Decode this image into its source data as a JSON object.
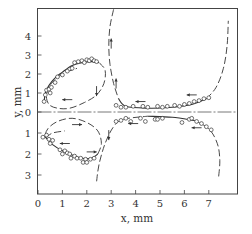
{
  "chart_data": {
    "type": "scatter",
    "title": "",
    "xlabel": "x, mm",
    "ylabel": "y, mm",
    "xlim": [
      0,
      8.2
    ],
    "ylim_upper": [
      0,
      5.4
    ],
    "ylim_lower": [
      0,
      3.9
    ],
    "x_ticks": [
      "0",
      "1",
      "2",
      "3",
      "4",
      "5",
      "6",
      "7"
    ],
    "y_ticks_upper": [
      "4",
      "3",
      "2",
      "1",
      "0"
    ],
    "y_ticks_lower": [
      "1",
      "2",
      "3"
    ],
    "grid": false,
    "legend": null,
    "center_line": "horizontal dash-dot line at y = 0",
    "colors": {
      "ink": "#333333",
      "frame": "#444444",
      "background": "#ffffff"
    },
    "series": [
      {
        "name": "upper-left loop measured points",
        "panel": "upper",
        "marker": "open-circle",
        "points": [
          [
            0.25,
            0.55
          ],
          [
            0.3,
            0.9
          ],
          [
            0.35,
            1.15
          ],
          [
            0.45,
            1.2
          ],
          [
            0.5,
            1.0
          ],
          [
            0.55,
            1.3
          ],
          [
            0.7,
            1.55
          ],
          [
            0.8,
            1.85
          ],
          [
            1.0,
            1.95
          ],
          [
            1.2,
            2.15
          ],
          [
            1.4,
            2.3
          ],
          [
            1.5,
            2.6
          ],
          [
            1.65,
            2.65
          ],
          [
            1.8,
            2.7
          ],
          [
            1.9,
            2.6
          ],
          [
            2.0,
            2.75
          ],
          [
            2.1,
            2.7
          ],
          [
            2.2,
            2.8
          ],
          [
            2.3,
            2.7
          ],
          [
            2.4,
            2.65
          ]
        ]
      },
      {
        "name": "upper-right curve measured points",
        "panel": "upper",
        "marker": "open-circle",
        "points": [
          [
            3.2,
            0.35
          ],
          [
            3.4,
            0.25
          ],
          [
            3.6,
            0.25
          ],
          [
            3.9,
            0.3
          ],
          [
            4.3,
            0.3
          ],
          [
            4.5,
            0.25
          ],
          [
            4.9,
            0.3
          ],
          [
            5.1,
            0.25
          ],
          [
            5.3,
            0.3
          ],
          [
            5.6,
            0.35
          ],
          [
            5.8,
            0.3
          ],
          [
            6.0,
            0.4
          ],
          [
            6.2,
            0.45
          ],
          [
            6.4,
            0.55
          ],
          [
            6.6,
            0.6
          ],
          [
            6.8,
            0.7
          ],
          [
            7.0,
            0.75
          ]
        ]
      },
      {
        "name": "lower-left loop measured points",
        "panel": "lower",
        "marker": "open-circle",
        "points": [
          [
            0.2,
            1.2
          ],
          [
            0.35,
            1.1
          ],
          [
            0.45,
            1.3
          ],
          [
            0.5,
            1.5
          ],
          [
            0.6,
            1.35
          ],
          [
            0.9,
            1.8
          ],
          [
            1.0,
            2.0
          ],
          [
            1.1,
            1.85
          ],
          [
            1.2,
            1.95
          ],
          [
            1.3,
            2.0
          ],
          [
            1.35,
            2.2
          ],
          [
            1.5,
            2.1
          ],
          [
            1.6,
            2.2
          ],
          [
            1.75,
            2.2
          ],
          [
            1.85,
            2.4
          ],
          [
            1.95,
            2.25
          ],
          [
            2.0,
            2.4
          ],
          [
            2.15,
            2.25
          ],
          [
            2.3,
            2.2
          ]
        ]
      },
      {
        "name": "lower-right curve measured points",
        "panel": "lower",
        "marker": "open-circle",
        "points": [
          [
            3.2,
            0.45
          ],
          [
            3.4,
            0.4
          ],
          [
            3.6,
            0.3
          ],
          [
            3.8,
            0.45
          ],
          [
            4.2,
            0.3
          ],
          [
            4.4,
            0.45
          ],
          [
            4.8,
            0.35
          ],
          [
            4.9,
            0.35
          ],
          [
            5.1,
            0.3
          ],
          [
            5.9,
            0.5
          ],
          [
            6.2,
            0.35
          ],
          [
            6.3,
            0.3
          ],
          [
            6.5,
            0.45
          ],
          [
            6.7,
            0.55
          ],
          [
            6.9,
            0.7
          ],
          [
            7.1,
            0.85
          ]
        ]
      },
      {
        "name": "upper-left computed trajectory (solid)",
        "panel": "upper",
        "style": "solid",
        "points": [
          [
            0.25,
            0.5
          ],
          [
            0.3,
            1.0
          ],
          [
            0.45,
            1.4
          ],
          [
            0.7,
            1.8
          ],
          [
            1.0,
            2.1
          ],
          [
            1.4,
            2.45
          ],
          [
            1.8,
            2.6
          ],
          [
            2.2,
            2.65
          ],
          [
            2.5,
            2.6
          ]
        ]
      },
      {
        "name": "upper-left computed trajectory (dashed loop)",
        "panel": "upper",
        "style": "dashed",
        "points": [
          [
            2.5,
            2.6
          ],
          [
            2.75,
            2.2
          ],
          [
            2.7,
            1.5
          ],
          [
            2.4,
            0.9
          ],
          [
            1.9,
            0.5
          ],
          [
            1.3,
            0.2
          ],
          [
            0.8,
            0.2
          ],
          [
            0.45,
            0.4
          ],
          [
            0.35,
            0.9
          ],
          [
            0.55,
            1.5
          ],
          [
            1.0,
            2.0
          ],
          [
            1.6,
            2.3
          ]
        ]
      },
      {
        "name": "upper-right computed trajectory",
        "panel": "upper",
        "style": "dashed-then-solid",
        "points": [
          [
            3.1,
            5.4
          ],
          [
            2.95,
            4.5
          ],
          [
            2.9,
            3.5
          ],
          [
            2.95,
            2.5
          ],
          [
            3.1,
            1.5
          ],
          [
            3.3,
            0.7
          ],
          [
            3.6,
            0.3
          ],
          [
            4.5,
            0.2
          ],
          [
            5.5,
            0.25
          ],
          [
            6.3,
            0.4
          ],
          [
            6.9,
            0.7
          ],
          [
            7.3,
            1.3
          ],
          [
            7.6,
            2.3
          ],
          [
            7.75,
            3.5
          ],
          [
            7.8,
            4.8
          ]
        ]
      },
      {
        "name": "lower-left computed trajectory (solid)",
        "panel": "lower",
        "style": "solid",
        "points": [
          [
            0.3,
            1.2
          ],
          [
            0.6,
            1.55
          ],
          [
            1.0,
            1.85
          ],
          [
            1.4,
            2.05
          ],
          [
            1.8,
            2.2
          ],
          [
            2.2,
            2.2
          ],
          [
            2.45,
            2.0
          ]
        ]
      },
      {
        "name": "lower-left computed trajectory (dashed loop)",
        "panel": "lower",
        "style": "dashed",
        "points": [
          [
            2.45,
            2.0
          ],
          [
            2.6,
            1.5
          ],
          [
            2.45,
            0.9
          ],
          [
            2.0,
            0.5
          ],
          [
            1.4,
            0.3
          ],
          [
            0.8,
            0.45
          ],
          [
            0.4,
            0.8
          ],
          [
            0.3,
            1.2
          ],
          [
            0.6,
            1.0
          ],
          [
            1.1,
            0.9
          ]
        ]
      },
      {
        "name": "lower-right computed trajectory",
        "panel": "lower",
        "style": "dashed-then-solid",
        "points": [
          [
            2.4,
            3.3
          ],
          [
            2.5,
            2.5
          ],
          [
            2.75,
            1.5
          ],
          [
            3.1,
            0.7
          ],
          [
            3.5,
            0.35
          ],
          [
            4.5,
            0.2
          ],
          [
            5.5,
            0.25
          ],
          [
            6.4,
            0.4
          ],
          [
            7.0,
            0.8
          ],
          [
            7.35,
            1.5
          ],
          [
            7.45,
            2.3
          ],
          [
            7.4,
            3.1
          ]
        ]
      }
    ],
    "direction_arrows": [
      {
        "panel": "upper",
        "at": [
          3.0,
          3.6
        ],
        "direction": "up"
      },
      {
        "panel": "upper",
        "at": [
          3.2,
          1.5
        ],
        "direction": "up"
      },
      {
        "panel": "upper",
        "at": [
          4.2,
          0.55
        ],
        "direction": "left"
      },
      {
        "panel": "upper",
        "at": [
          6.3,
          0.9
        ],
        "direction": "left"
      },
      {
        "panel": "upper",
        "at": [
          1.2,
          0.65
        ],
        "direction": "left"
      },
      {
        "panel": "upper",
        "at": [
          2.4,
          1.1
        ],
        "direction": "down"
      },
      {
        "panel": "lower",
        "at": [
          1.6,
          0.6
        ],
        "direction": "right"
      },
      {
        "panel": "lower",
        "at": [
          1.1,
          1.5
        ],
        "direction": "left"
      },
      {
        "panel": "lower",
        "at": [
          2.2,
          1.9
        ],
        "direction": "right"
      },
      {
        "panel": "lower",
        "at": [
          2.9,
          1.1
        ],
        "direction": "down"
      },
      {
        "panel": "lower",
        "at": [
          3.9,
          0.55
        ],
        "direction": "left"
      },
      {
        "panel": "lower",
        "at": [
          6.5,
          0.75
        ],
        "direction": "left"
      }
    ]
  }
}
